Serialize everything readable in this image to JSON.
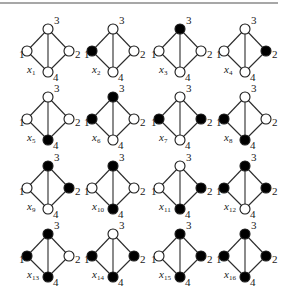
{
  "figure": {
    "top_rule": {
      "x1": 0,
      "x2": 278,
      "y": 3,
      "color": "#8a8a8a"
    },
    "node_labels": [
      "1",
      "2",
      "3",
      "4"
    ],
    "edges": [
      [
        "1",
        "3"
      ],
      [
        "3",
        "2"
      ],
      [
        "2",
        "4"
      ],
      [
        "4",
        "1"
      ],
      [
        "3",
        "4"
      ]
    ],
    "colors": {
      "filled": "#000000",
      "empty": "#ffffff",
      "stroke": "#1a1a1a"
    },
    "layout": {
      "column_centers": [
        48,
        113,
        180,
        245
      ],
      "row_top_y": [
        29,
        97,
        166,
        234
      ],
      "half_width": 21,
      "half_height": 21,
      "node_radius": 5
    },
    "graphs": [
      {
        "name": "x",
        "sub": "1",
        "filled": []
      },
      {
        "name": "x",
        "sub": "2",
        "filled": [
          "1"
        ]
      },
      {
        "name": "x",
        "sub": "3",
        "filled": [
          "3"
        ]
      },
      {
        "name": "x",
        "sub": "4",
        "filled": [
          "2"
        ]
      },
      {
        "name": "x",
        "sub": "5",
        "filled": [
          "4"
        ]
      },
      {
        "name": "x",
        "sub": "6",
        "filled": [
          "1",
          "3"
        ]
      },
      {
        "name": "x",
        "sub": "7",
        "filled": [
          "1",
          "2"
        ]
      },
      {
        "name": "x",
        "sub": "8",
        "filled": [
          "1",
          "4"
        ]
      },
      {
        "name": "x",
        "sub": "9",
        "filled": [
          "3",
          "2"
        ]
      },
      {
        "name": "x",
        "sub": "10",
        "filled": [
          "3",
          "4"
        ]
      },
      {
        "name": "x",
        "sub": "11",
        "filled": [
          "2",
          "4"
        ]
      },
      {
        "name": "x",
        "sub": "12",
        "filled": [
          "1",
          "3",
          "2"
        ]
      },
      {
        "name": "x",
        "sub": "13",
        "filled": [
          "1",
          "3",
          "4"
        ]
      },
      {
        "name": "x",
        "sub": "14",
        "filled": [
          "1",
          "2",
          "4"
        ]
      },
      {
        "name": "x",
        "sub": "15",
        "filled": [
          "3",
          "2",
          "4"
        ]
      },
      {
        "name": "x",
        "sub": "16",
        "filled": [
          "1",
          "2",
          "3",
          "4"
        ]
      }
    ]
  }
}
